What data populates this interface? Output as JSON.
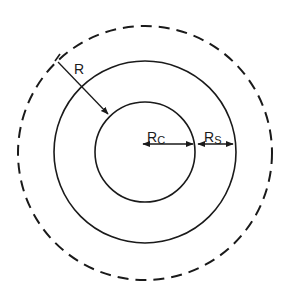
{
  "diagram": {
    "title": "",
    "colors": {
      "stroke": "#1a1a1a",
      "background": "#ffffff"
    },
    "circles": [
      {
        "id": "outer-dashed",
        "style": "dashed",
        "cx": 145,
        "cy": 153,
        "r": 127
      },
      {
        "id": "outer-solid",
        "style": "solid",
        "cx": 145,
        "cy": 152,
        "r": 91
      },
      {
        "id": "inner-core",
        "style": "solid",
        "cx": 145,
        "cy": 152,
        "r": 50
      }
    ],
    "labels": {
      "R": {
        "main": "R",
        "sub": ""
      },
      "Rc": {
        "main": "R",
        "sub": "C"
      },
      "Rs": {
        "main": "R",
        "sub": "S"
      }
    }
  }
}
